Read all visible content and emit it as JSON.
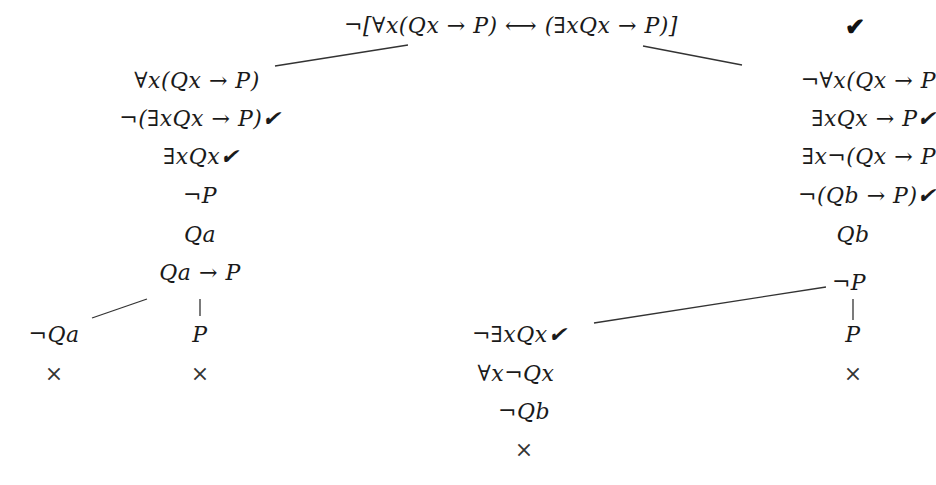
{
  "diagram": {
    "type": "truth-tree",
    "root": {
      "formula": "¬[∀x(Qx → P) ⟷ (∃xQx → P)]",
      "check": "✔"
    },
    "left_branch": {
      "nodes": [
        "∀x(Qx → P)",
        "¬(∃xQx → P)✔",
        "∃xQx✔",
        "¬P",
        "Qa",
        "Qa → P"
      ],
      "split": {
        "left": {
          "nodes": [
            "¬Qa"
          ],
          "closed": "×"
        },
        "right": {
          "nodes": [
            "P"
          ],
          "closed": "×"
        }
      }
    },
    "right_branch": {
      "nodes": [
        "¬∀x(Qx → P",
        "∃xQx → P✔",
        "∃x¬(Qx → P",
        "¬(Qb → P)✔",
        "Qb"
      ],
      "split": {
        "left": {
          "nodes": [
            "¬∃xQx✔",
            "∀x¬Qx",
            "¬Qb"
          ],
          "closed": "×"
        },
        "right": {
          "nodes": [
            "¬P",
            "P"
          ],
          "closed": "×"
        }
      }
    }
  }
}
